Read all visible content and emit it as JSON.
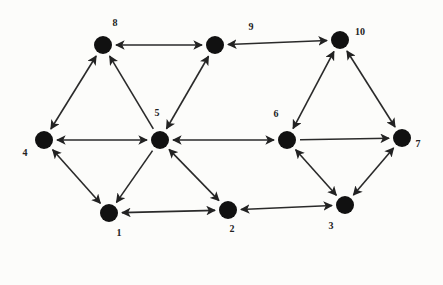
{
  "diagram": {
    "type": "directed-graph",
    "nodes": [
      {
        "id": "1",
        "label": "1",
        "x": 109,
        "y": 213,
        "lx": 119,
        "ly": 236
      },
      {
        "id": "2",
        "label": "2",
        "x": 228,
        "y": 210,
        "lx": 232,
        "ly": 232
      },
      {
        "id": "3",
        "label": "3",
        "x": 345,
        "y": 205,
        "lx": 331,
        "ly": 229
      },
      {
        "id": "4",
        "label": "4",
        "x": 44,
        "y": 140,
        "lx": 25,
        "ly": 156
      },
      {
        "id": "5",
        "label": "5",
        "x": 160,
        "y": 140,
        "lx": 157,
        "ly": 116
      },
      {
        "id": "6",
        "label": "6",
        "x": 287,
        "y": 140,
        "lx": 276,
        "ly": 117
      },
      {
        "id": "7",
        "label": "7",
        "x": 402,
        "y": 138,
        "lx": 418,
        "ly": 147
      },
      {
        "id": "8",
        "label": "8",
        "x": 103,
        "y": 45,
        "lx": 115,
        "ly": 26
      },
      {
        "id": "9",
        "label": "9",
        "x": 215,
        "y": 45,
        "lx": 251,
        "ly": 30
      },
      {
        "id": "10",
        "label": "10",
        "x": 340,
        "y": 40,
        "lx": 360,
        "ly": 35
      }
    ],
    "edges": [
      {
        "from": "8",
        "to": "9",
        "bidirectional": true
      },
      {
        "from": "9",
        "to": "10",
        "bidirectional": true
      },
      {
        "from": "8",
        "to": "4",
        "bidirectional": true
      },
      {
        "from": "5",
        "to": "8",
        "bidirectional": false
      },
      {
        "from": "9",
        "to": "5",
        "bidirectional": true
      },
      {
        "from": "4",
        "to": "5",
        "bidirectional": true
      },
      {
        "from": "5",
        "to": "6",
        "bidirectional": true
      },
      {
        "from": "10",
        "to": "6",
        "bidirectional": true
      },
      {
        "from": "10",
        "to": "7",
        "bidirectional": true
      },
      {
        "from": "6",
        "to": "7",
        "bidirectional": false
      },
      {
        "from": "4",
        "to": "1",
        "bidirectional": true
      },
      {
        "from": "5",
        "to": "1",
        "bidirectional": false
      },
      {
        "from": "5",
        "to": "2",
        "bidirectional": true
      },
      {
        "from": "1",
        "to": "2",
        "bidirectional": true
      },
      {
        "from": "2",
        "to": "3",
        "bidirectional": true
      },
      {
        "from": "6",
        "to": "3",
        "bidirectional": true
      },
      {
        "from": "7",
        "to": "3",
        "bidirectional": true
      }
    ],
    "colors": {
      "node": "#111111",
      "edge": "#2a2a2a",
      "background": "#fcfcfa"
    }
  }
}
